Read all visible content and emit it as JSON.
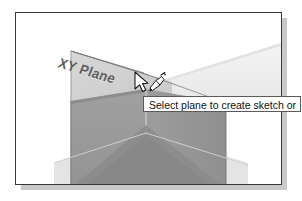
{
  "viewport": {
    "name": "cad-3d-viewport",
    "background_color": "#ffffff",
    "border_color": "#3a3a3a",
    "shadow_color": "#c9c9c9"
  },
  "scene": {
    "plane_label": "XY Plane",
    "highlighted_plane_color": "#d2d2d2",
    "far_plane_color": "#f0f0f0",
    "solid_box_color": "#9a9a9a",
    "solid_box_shadow_color": "#8a8a8a",
    "edge_color": "#6d6d6d",
    "ground_plane_color": "#e8e8e8"
  },
  "cursor": {
    "name": "arrow-sketch-cursor",
    "label": "pointer with sketch tool",
    "x": 118,
    "y": 58
  },
  "tooltip": {
    "text": "Select plane to create sketch or",
    "background_color": "#ffffff",
    "border_color": "#5a5a5a",
    "text_color": "#101010"
  }
}
